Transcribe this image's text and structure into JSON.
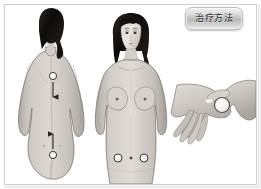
{
  "panel": {
    "title_badge": "治疗方法",
    "background_color": "#ffffff",
    "frame_color": "#cfcfcf",
    "badge_text_color": "#2b2b2b"
  },
  "figures": [
    {
      "id": "back-view",
      "label": "female-back-view",
      "view": "posterior",
      "skin_color": "#c9c4bd",
      "hair_color": "#1a1a1a",
      "acupoints": [
        {
          "name": "upper-back-point",
          "x": 48,
          "y": 71,
          "marker": "circle"
        },
        {
          "name": "lower-back-point",
          "x": 48,
          "y": 150,
          "marker": "circle"
        }
      ],
      "arrows": [
        {
          "name": "upper-arrow-down",
          "direction": "down",
          "from_y": 78,
          "to_y": 94
        },
        {
          "name": "lower-arrow-up",
          "direction": "up",
          "from_y": 144,
          "to_y": 128
        }
      ]
    },
    {
      "id": "front-view",
      "label": "female-front-view",
      "view": "anterior",
      "skin_color": "#cbc6bf",
      "hair_color": "#1c1a18",
      "acupoints": [
        {
          "name": "left-abdomen-point",
          "x": 113,
          "y": 153,
          "marker": "circle"
        },
        {
          "name": "navel-point",
          "x": 126,
          "y": 153,
          "marker": "dot"
        },
        {
          "name": "right-abdomen-point",
          "x": 139,
          "y": 153,
          "marker": "circle"
        }
      ]
    },
    {
      "id": "hand-view",
      "label": "hand-massage-demonstration",
      "view": "hand-dorsum",
      "skin_color": "#cbc7c0",
      "acupoints": [
        {
          "name": "hand-point",
          "x": 217,
          "y": 100,
          "marker": "circle"
        }
      ]
    }
  ],
  "marker_style": {
    "fill": "#f7f7f4",
    "stroke": "#3a3a3a",
    "arrow_color": "#2a2a2a"
  }
}
